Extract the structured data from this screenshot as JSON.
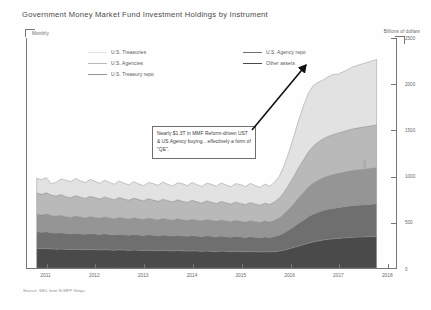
{
  "chart_title": "Government Money Market Fund Investment Holdings by Instrument",
  "frequency_label": "Monthly",
  "unit_label": "Billions of dollars",
  "source_note": "Source: SEC form N-MFP filings.",
  "side_note": "MMF Reform",
  "annotation": {
    "text": "Nearly $1.3T in MMF Reform-driven UST & US Agency buying…effectively a form of \"QE\"."
  },
  "legend": [
    {
      "label": "U.S. Treasuries",
      "color": "#e2e2e2",
      "column": "left",
      "row": 0
    },
    {
      "label": "U.S. Agencies",
      "color": "#b9b9b9",
      "column": "left",
      "row": 1
    },
    {
      "label": "U.S. Treasury repo",
      "color": "#959595",
      "column": "left",
      "row": 2
    },
    {
      "label": "U.S. Agency repo",
      "color": "#6f6f6f",
      "column": "right",
      "row": 0
    },
    {
      "label": "Other assets",
      "color": "#4a4a4a",
      "column": "right",
      "row": 1
    }
  ],
  "chart_data": {
    "type": "area",
    "stacked": true,
    "title": "Government Money Market Fund Investment Holdings by Instrument",
    "xlabel": "",
    "ylabel": "Billions of dollars",
    "ylim": [
      0,
      2500
    ],
    "yticks": [
      0,
      500,
      1000,
      1500,
      2000,
      2500
    ],
    "xlim": [
      2010.6,
      2018.2
    ],
    "xticks": [
      2011,
      2012,
      2013,
      2014,
      2015,
      2016,
      2017,
      2018
    ],
    "grid": false,
    "legend_position": "top-inside",
    "x": [
      2010.8,
      2010.9,
      2011.0,
      2011.1,
      2011.2,
      2011.3,
      2011.4,
      2011.5,
      2011.6,
      2011.7,
      2011.8,
      2011.9,
      2012.0,
      2012.1,
      2012.2,
      2012.3,
      2012.4,
      2012.5,
      2012.6,
      2012.7,
      2012.8,
      2012.9,
      2013.0,
      2013.1,
      2013.2,
      2013.3,
      2013.4,
      2013.5,
      2013.6,
      2013.7,
      2013.8,
      2013.9,
      2014.0,
      2014.1,
      2014.2,
      2014.3,
      2014.4,
      2014.5,
      2014.6,
      2014.7,
      2014.8,
      2014.9,
      2015.0,
      2015.1,
      2015.2,
      2015.3,
      2015.4,
      2015.5,
      2015.6,
      2015.7,
      2015.8,
      2015.9,
      2016.0,
      2016.1,
      2016.2,
      2016.3,
      2016.4,
      2016.5,
      2016.6,
      2016.7,
      2016.8,
      2016.9,
      2017.0,
      2017.1,
      2017.2,
      2017.3,
      2017.4,
      2017.5,
      2017.6,
      2017.7,
      2017.8
    ],
    "series": [
      {
        "name": "Other assets",
        "color": "#4a4a4a",
        "values": [
          215,
          210,
          212,
          208,
          205,
          207,
          203,
          200,
          204,
          201,
          198,
          202,
          199,
          196,
          200,
          197,
          194,
          198,
          195,
          192,
          196,
          193,
          190,
          194,
          191,
          188,
          192,
          189,
          186,
          190,
          187,
          184,
          188,
          185,
          182,
          186,
          183,
          180,
          184,
          181,
          178,
          182,
          179,
          176,
          180,
          177,
          174,
          178,
          175,
          180,
          185,
          195,
          210,
          225,
          240,
          255,
          272,
          285,
          295,
          305,
          312,
          318,
          322,
          326,
          330,
          334,
          336,
          338,
          340,
          342,
          344
        ]
      },
      {
        "name": "U.S. Agency repo",
        "color": "#6f6f6f",
        "values": [
          180,
          178,
          182,
          176,
          174,
          178,
          172,
          170,
          175,
          171,
          168,
          173,
          170,
          167,
          172,
          168,
          165,
          170,
          167,
          164,
          169,
          166,
          163,
          168,
          165,
          162,
          167,
          164,
          161,
          166,
          163,
          160,
          165,
          162,
          159,
          164,
          161,
          158,
          163,
          160,
          157,
          162,
          159,
          156,
          161,
          158,
          155,
          160,
          157,
          163,
          172,
          188,
          205,
          225,
          248,
          268,
          288,
          302,
          312,
          320,
          326,
          330,
          334,
          338,
          340,
          344,
          346,
          348,
          350,
          352,
          354
        ]
      },
      {
        "name": "U.S. Treasury repo",
        "color": "#959595",
        "values": [
          190,
          188,
          192,
          186,
          184,
          188,
          182,
          180,
          186,
          182,
          178,
          184,
          181,
          177,
          183,
          179,
          176,
          182,
          178,
          175,
          181,
          177,
          174,
          180,
          176,
          173,
          179,
          175,
          172,
          178,
          174,
          171,
          177,
          173,
          170,
          176,
          172,
          169,
          175,
          171,
          168,
          174,
          170,
          167,
          173,
          169,
          166,
          172,
          168,
          176,
          188,
          206,
          228,
          252,
          278,
          300,
          322,
          338,
          348,
          356,
          362,
          366,
          370,
          374,
          378,
          382,
          384,
          386,
          388,
          390,
          392
        ]
      },
      {
        "name": "U.S. Agencies",
        "color": "#b9b9b9",
        "values": [
          230,
          226,
          232,
          224,
          220,
          226,
          218,
          214,
          222,
          216,
          212,
          220,
          215,
          210,
          218,
          212,
          208,
          216,
          210,
          206,
          214,
          208,
          204,
          212,
          206,
          202,
          210,
          204,
          200,
          208,
          202,
          198,
          206,
          200,
          196,
          204,
          198,
          194,
          202,
          196,
          192,
          200,
          194,
          190,
          198,
          192,
          188,
          196,
          190,
          200,
          216,
          240,
          268,
          298,
          330,
          358,
          384,
          402,
          414,
          424,
          430,
          435,
          440,
          444,
          448,
          452,
          455,
          458,
          460,
          462,
          464
        ]
      },
      {
        "name": "U.S. Treasuries",
        "color": "#e2e2e2",
        "values": [
          160,
          158,
          164,
          120,
          150,
          168,
          180,
          176,
          186,
          178,
          172,
          184,
          178,
          170,
          182,
          174,
          168,
          180,
          172,
          166,
          178,
          170,
          164,
          176,
          180,
          174,
          186,
          178,
          172,
          184,
          190,
          182,
          194,
          186,
          180,
          192,
          196,
          188,
          200,
          194,
          188,
          200,
          204,
          196,
          208,
          200,
          194,
          206,
          200,
          214,
          240,
          290,
          360,
          440,
          520,
          590,
          640,
          660,
          650,
          640,
          648,
          655,
          640,
          648,
          660,
          672,
          680,
          688,
          696,
          704,
          712
        ]
      }
    ]
  }
}
